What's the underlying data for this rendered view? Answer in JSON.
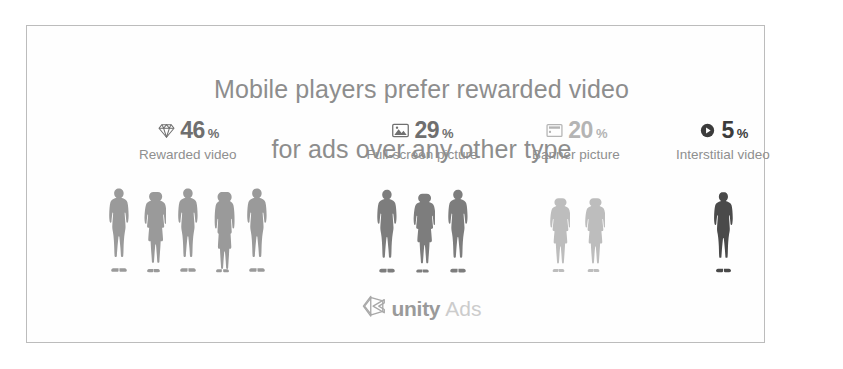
{
  "title": {
    "line1": "Mobile players prefer rewarded video",
    "line2": "for ads over any other type",
    "color": "#8d8d8d"
  },
  "frame": {
    "border_color": "#bcbcbc"
  },
  "stats": [
    {
      "icon": "diamond-icon",
      "value": "46",
      "percent": "%",
      "label": "Rewarded video",
      "color": "#6f6f6f",
      "figure_color": "#9a9a9a",
      "figure_count": 5,
      "figures": [
        "man",
        "woman",
        "man",
        "woman-long-hair",
        "man"
      ]
    },
    {
      "icon": "picture-icon",
      "value": "29",
      "percent": "%",
      "label": "Full-screen picture",
      "color": "#6f6f6f",
      "figure_color": "#7d7d7d",
      "figure_count": 3,
      "figures": [
        "man",
        "woman",
        "man"
      ]
    },
    {
      "icon": "banner-icon",
      "value": "20",
      "percent": "%",
      "label": "Banner picture",
      "color": "#b4b4b4",
      "figure_color": "#bdbdbd",
      "figure_count": 2,
      "figures": [
        "woman",
        "woman"
      ]
    },
    {
      "icon": "play-circle-icon",
      "value": "5",
      "percent": "%",
      "label": "Interstitial video",
      "color": "#3b3b3b",
      "figure_color": "#4a4a4a",
      "figure_count": 1,
      "figures": [
        "man"
      ]
    }
  ],
  "footer": {
    "logo_mark": "unity-cube-icon",
    "brand": "unity",
    "product": "Ads",
    "brand_color": "#9a9a9a",
    "product_color": "#cccccc"
  }
}
